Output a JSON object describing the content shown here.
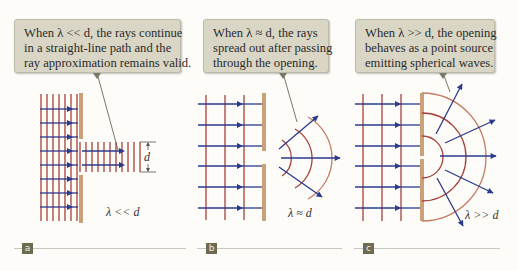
{
  "panels": [
    {
      "id": "a",
      "tag": "a",
      "callout_lines": [
        "When λ << d, the rays continue",
        "in a straight-line path and the",
        "ray approximation remains valid."
      ],
      "condition_label": "λ << d",
      "dimension_label": "d"
    },
    {
      "id": "b",
      "tag": "b",
      "callout_lines": [
        "When λ ≈ d, the rays",
        "spread out after passing",
        "through the opening."
      ],
      "condition_label": "λ ≈ d"
    },
    {
      "id": "c",
      "tag": "c",
      "callout_lines": [
        "When λ >> d, the opening",
        "behaves as a point source",
        "emitting spherical waves."
      ],
      "condition_label": "λ >> d"
    }
  ],
  "colors": {
    "ray": "#2a3a8c",
    "wavefront": "#a8403a",
    "wavefront_light": "#c77a63",
    "barrier": "#c9a27c",
    "callout_bg": "#d9d6c5",
    "tag_bg": "#6d6b52",
    "rule": "#c9c8c0"
  }
}
